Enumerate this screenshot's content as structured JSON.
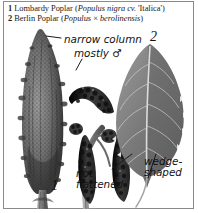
{
  "plate": {
    "border_color": "#8a8a8a",
    "background": "#ffffff"
  },
  "caption": {
    "entries": [
      {
        "number": "1",
        "common_name": "Lombardy Poplar",
        "scientific_open": "(",
        "genus_species": "Populus nigra",
        "cultivar_prefix": "cv.",
        "cultivar": "'Italica'",
        "scientific_close": ")"
      },
      {
        "number": "2",
        "common_name": "Berlin Poplar",
        "scientific_open": "(",
        "genus_species": "Populus",
        "hybrid_sign": "×",
        "epithet": "berolinensis",
        "scientific_close": ")"
      }
    ]
  },
  "figure_numbers": {
    "tree": "1",
    "leaf": "2"
  },
  "annotations": [
    {
      "name": "narrow-column",
      "line1": "narrow column",
      "line2": ""
    },
    {
      "name": "mostly-male",
      "line1": "mostly ♂",
      "line2": ""
    },
    {
      "name": "not-flattened",
      "line1": "not",
      "line2": "flattened"
    },
    {
      "name": "wedge-shaped",
      "line1": "wedge-",
      "line2": "shaped"
    }
  ],
  "illustration": {
    "subjects": [
      "columnar-poplar-tree",
      "male-catkin-branch",
      "poplar-leaf"
    ],
    "ink_color": "#2b2b2b",
    "mid_tone": "#7d7d7d",
    "light_tone": "#b9b9b9"
  }
}
